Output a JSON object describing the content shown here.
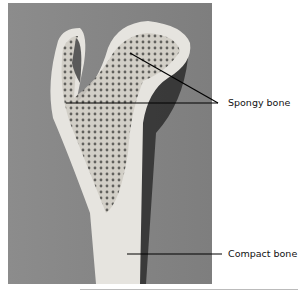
{
  "figure": {
    "labels": [
      {
        "text": "Spongy bone",
        "x": 228,
        "y": 97
      },
      {
        "text": "Compact bone",
        "x": 228,
        "y": 248
      }
    ],
    "colors": {
      "background": "#8a8a8a",
      "bone_light": "#e6e4df",
      "bone_spongy_dark": "#4a4a46",
      "shadow": "#1f1f1f",
      "leader_line": "#000000"
    }
  }
}
